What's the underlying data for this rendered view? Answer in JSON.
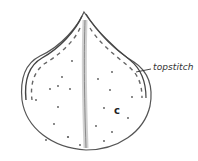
{
  "diagram": {
    "labels": {
      "topstitch": "topstitch",
      "piece": "c"
    },
    "colors": {
      "outline": "#555555",
      "stitch": "#666666",
      "center_shading": "#9a9a9a",
      "background": "#ffffff"
    }
  }
}
